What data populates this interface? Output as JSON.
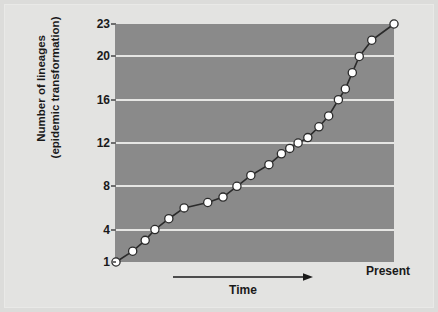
{
  "figure": {
    "background_color": "#dcdcda",
    "panel_color": "#e3e3e1",
    "plot_background_color": "#8a8a8a",
    "gridline_color": "#e6e6e4",
    "line_color": "#2b2b2b",
    "marker_fill_color": "#ffffff",
    "marker_edge_color": "#2b2b2b"
  },
  "axes": {
    "y_title_line1": "Number of lineages",
    "y_title_line2": "(epidemic transformation)",
    "x_title": "Time",
    "x_end_label": "Present",
    "y_ticks": [
      1,
      4,
      8,
      12,
      16,
      20,
      23
    ],
    "y_tick_labels": [
      "1",
      "4",
      "8",
      "12",
      "16",
      "20",
      "23"
    ],
    "gridline_values": [
      4,
      8,
      12,
      16,
      20
    ]
  },
  "chart_data": {
    "type": "line",
    "title": "",
    "xlabel": "Time",
    "ylabel": "Number of lineages (epidemic transformation)",
    "xlim": [
      0,
      100
    ],
    "ylim": [
      1,
      23
    ],
    "grid": true,
    "legend": "none",
    "marker": "circle",
    "x_tick_labels": [
      "Time",
      "Present"
    ],
    "y_tick_labels": [
      "1",
      "4",
      "8",
      "12",
      "16",
      "20",
      "23"
    ],
    "x": [
      0.0,
      6.0,
      10.5,
      14.0,
      19.0,
      24.5,
      33.0,
      38.5,
      43.5,
      48.5,
      55.0,
      59.5,
      62.5,
      65.5,
      69.0,
      73.0,
      76.5,
      80.0,
      82.5,
      85.0,
      87.5,
      92.0,
      100.0
    ],
    "values": [
      1,
      2,
      3,
      4,
      5,
      6,
      6.5,
      7,
      8,
      9,
      10,
      11,
      11.5,
      12,
      12.5,
      13.5,
      14.5,
      16,
      17,
      18.5,
      20,
      21.5,
      23
    ],
    "series": [
      {
        "name": "lineages",
        "points": [
          {
            "x": 0.0,
            "y": 1
          },
          {
            "x": 6.0,
            "y": 2
          },
          {
            "x": 10.5,
            "y": 3
          },
          {
            "x": 14.0,
            "y": 4
          },
          {
            "x": 19.0,
            "y": 5
          },
          {
            "x": 24.5,
            "y": 6
          },
          {
            "x": 33.0,
            "y": 6.5
          },
          {
            "x": 38.5,
            "y": 7
          },
          {
            "x": 43.5,
            "y": 8
          },
          {
            "x": 48.5,
            "y": 9
          },
          {
            "x": 55.0,
            "y": 10
          },
          {
            "x": 59.5,
            "y": 11
          },
          {
            "x": 62.5,
            "y": 11.5
          },
          {
            "x": 65.5,
            "y": 12
          },
          {
            "x": 69.0,
            "y": 12.5
          },
          {
            "x": 73.0,
            "y": 13.5
          },
          {
            "x": 76.5,
            "y": 14.5
          },
          {
            "x": 80.0,
            "y": 16
          },
          {
            "x": 82.5,
            "y": 17
          },
          {
            "x": 85.0,
            "y": 18.5
          },
          {
            "x": 87.5,
            "y": 20
          },
          {
            "x": 92.0,
            "y": 21.5
          },
          {
            "x": 100.0,
            "y": 23
          }
        ]
      }
    ],
    "n_points": 23
  }
}
